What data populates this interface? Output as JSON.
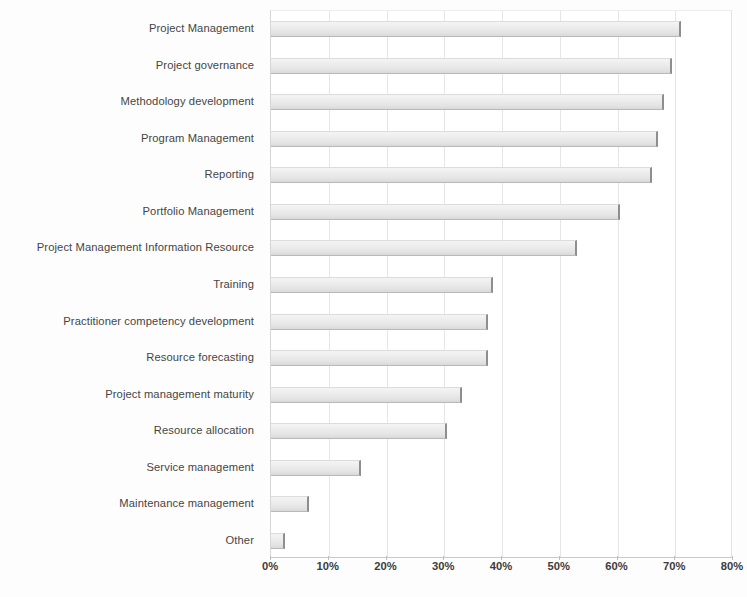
{
  "chart_data": {
    "type": "bar",
    "orientation": "horizontal",
    "title": "",
    "subtitle": "",
    "xlabel": "",
    "ylabel": "",
    "xlim": [
      0,
      80
    ],
    "ylim": null,
    "grid": true,
    "legend": null,
    "legend_position": "none",
    "value_suffix": "%",
    "xtick_labels": [
      "0%",
      "10%",
      "20%",
      "30%",
      "40%",
      "50%",
      "60%",
      "70%",
      "80%"
    ],
    "xticks": [
      0,
      10,
      20,
      30,
      40,
      50,
      60,
      70,
      80
    ],
    "categories": [
      "Project Management",
      "Project governance",
      "Methodology development",
      "Program Management",
      "Reporting",
      "Portfolio Management",
      "Project Management Information Resource",
      "Training",
      "Practitioner competency development",
      "Resource forecasting",
      "Project management maturity",
      "Resource allocation",
      "Service management",
      "Maintenance management",
      "Other"
    ],
    "values": [
      71,
      69.5,
      68,
      67,
      66,
      60.5,
      53,
      38.5,
      37.5,
      37.5,
      33,
      30.5,
      15.5,
      6.5,
      2.5
    ],
    "series": [
      {
        "name": "Share of respondents",
        "values": [
          71,
          69.5,
          68,
          67,
          66,
          60.5,
          53,
          38.5,
          37.5,
          37.5,
          33,
          30.5,
          15.5,
          6.5,
          2.5
        ]
      }
    ],
    "colors": {
      "bar_fill": "#ececec",
      "bar_edge": "#8e8e8e",
      "gridline": "#e6e6e6",
      "axis": "#c4c4c4",
      "text": "#454545",
      "background": "#ffffff"
    }
  }
}
